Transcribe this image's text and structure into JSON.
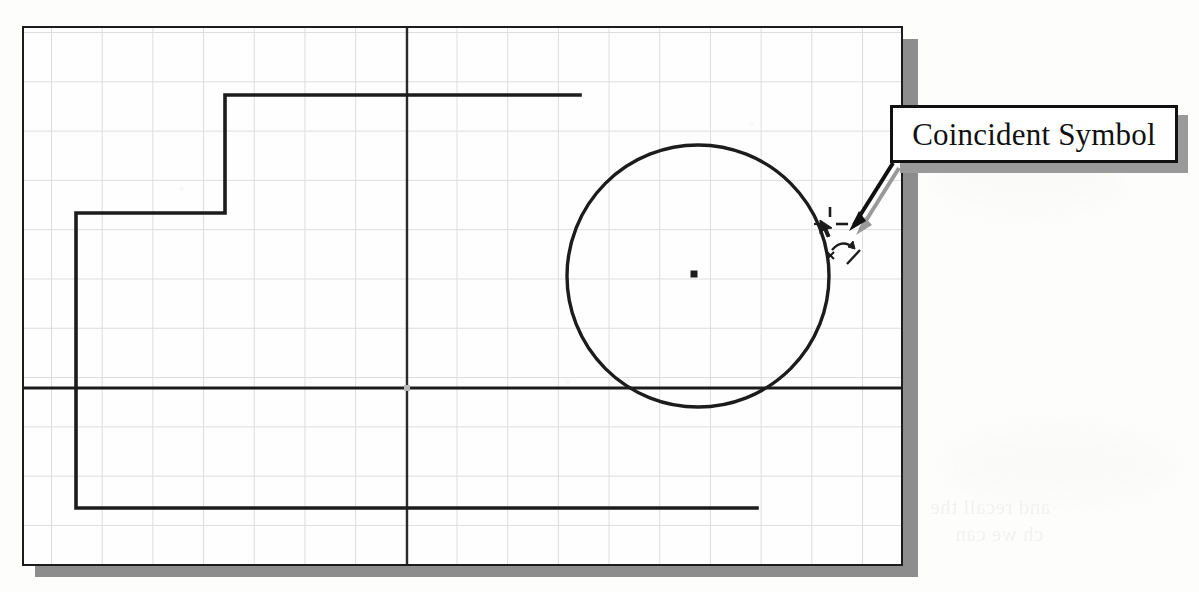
{
  "document": {
    "kind": "scanned-cad-sketch-figure",
    "background_color": "#fdfdfc"
  },
  "frame": {
    "name": "sketch-drawing-frame",
    "border_color": "#1c1c1c",
    "fill_color": "#fefefe",
    "shadow_color": "#8d8d8d",
    "x": 22,
    "y": 26,
    "width": 881,
    "height": 540
  },
  "grid": {
    "name": "graph-paper-grid",
    "line_color": "#c9c9c9",
    "spacing_x": 50.7,
    "spacing_y": 49.3,
    "columns": 17,
    "rows": 11
  },
  "callout": {
    "label": "Coincident Symbol",
    "text_color": "#111111",
    "box_fill": "#ffffff",
    "box_border": "#111111",
    "shadow_color": "#9a9a9a"
  },
  "leader": {
    "name": "leader-arrow",
    "color": "#111111",
    "shadow_color": "#9a9a9a",
    "from_x": 893,
    "from_y": 163,
    "to_x": 858,
    "to_y": 223
  },
  "chart_data": {
    "type": "scatter",
    "title": "Coincident Symbol",
    "xlabel": "",
    "ylabel": "",
    "grid": true,
    "legend": "none",
    "xlim": [
      0,
      877
    ],
    "ylim": [
      0,
      536
    ],
    "annotations": [
      {
        "name": "coincident-symbol-callout",
        "text": "Coincident Symbol",
        "x": 1034,
        "y": 134,
        "points_to_x": 858,
        "points_to_y": 223
      }
    ],
    "entities": [
      {
        "name": "circle",
        "type": "circle",
        "cx": 674,
        "cy": 248,
        "r": 131,
        "stroke": "#1c1c1c",
        "stroke_width": 3.2
      },
      {
        "name": "circle-center-point",
        "type": "point",
        "x": 670,
        "y": 246,
        "size": 7,
        "fill": "#1c1c1c"
      },
      {
        "name": "origin-point",
        "type": "point",
        "x": 383,
        "y": 360,
        "size": 6,
        "fill": "#b8b8b8"
      },
      {
        "name": "horizontal-centerline",
        "type": "line",
        "x1": 0,
        "y1": 360,
        "x2": 877,
        "y2": 360,
        "stroke": "#1c1c1c",
        "stroke_width": 3
      },
      {
        "name": "vertical-centerline",
        "type": "line",
        "x1": 383,
        "y1": 0,
        "x2": 383,
        "y2": 536,
        "stroke": "#2a2a2a",
        "stroke_width": 2.4
      },
      {
        "name": "profile-top-horizontal",
        "type": "line",
        "x1": 200,
        "y1": 67,
        "x2": 556,
        "y2": 67,
        "stroke": "#1c1c1c",
        "stroke_width": 3.4
      },
      {
        "name": "profile-step-vertical",
        "type": "line",
        "x1": 201,
        "y1": 67,
        "x2": 201,
        "y2": 186,
        "stroke": "#1c1c1c",
        "stroke_width": 3.4
      },
      {
        "name": "profile-step-horizontal",
        "type": "line",
        "x1": 52,
        "y1": 185,
        "x2": 202,
        "y2": 185,
        "stroke": "#1c1c1c",
        "stroke_width": 3.4
      },
      {
        "name": "profile-left-vertical",
        "type": "line",
        "x1": 52,
        "y1": 185,
        "x2": 52,
        "y2": 481,
        "stroke": "#1c1c1c",
        "stroke_width": 3.4
      },
      {
        "name": "profile-bottom-horizontal",
        "type": "line",
        "x1": 52,
        "y1": 480,
        "x2": 733,
        "y2": 480,
        "stroke": "#1c1c1c",
        "stroke_width": 3.4
      }
    ],
    "coincident_symbol": {
      "name": "coincident-constraint-symbol",
      "x": 820,
      "y": 205,
      "width": 48,
      "height": 52,
      "parts": [
        "cursor-glyph",
        "vertical-dash",
        "horizontal-dash",
        "curved-arrow",
        "x-mark",
        "diagonal-tick"
      ],
      "stroke": "#1c1c1c"
    }
  },
  "bleed_through": {
    "note": "faint reverse-side text visible through scanned paper",
    "lines": [
      "and recall the",
      "ch we can"
    ]
  }
}
